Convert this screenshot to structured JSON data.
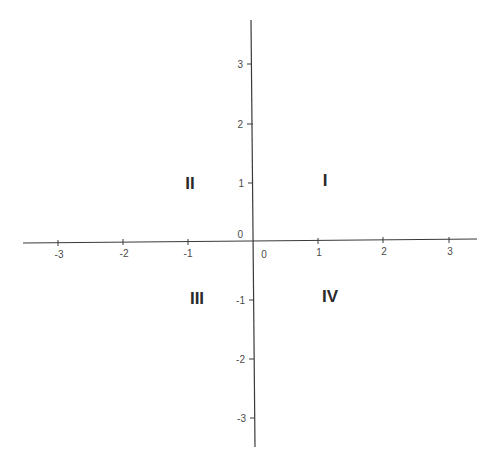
{
  "diagram": {
    "type": "cartesian-coordinate-plane",
    "colors": {
      "axis": "#3a3a3a",
      "tick_label": "#4a4a4a",
      "quadrant_label": "#2a2a2a",
      "background": "#ffffff"
    },
    "x_axis": {
      "range": [
        -3.5,
        3.5
      ],
      "origin_label": "0",
      "ticks": [
        {
          "value": -3,
          "label": "-3"
        },
        {
          "value": -2,
          "label": "-2"
        },
        {
          "value": -1,
          "label": "-1"
        },
        {
          "value": 1,
          "label": "1"
        },
        {
          "value": 2,
          "label": "2"
        },
        {
          "value": 3,
          "label": "3"
        }
      ]
    },
    "y_axis": {
      "range": [
        -3.5,
        3.5
      ],
      "origin_label": "0",
      "ticks": [
        {
          "value": 3,
          "label": "3"
        },
        {
          "value": 2,
          "label": "2"
        },
        {
          "value": 1,
          "label": "1"
        },
        {
          "value": -1,
          "label": "-1"
        },
        {
          "value": -2,
          "label": "-2"
        },
        {
          "value": -3,
          "label": "-3"
        }
      ]
    },
    "quadrants": [
      {
        "id": "I",
        "label": "I"
      },
      {
        "id": "II",
        "label": "II"
      },
      {
        "id": "III",
        "label": "III"
      },
      {
        "id": "IV",
        "label": "IV"
      }
    ]
  }
}
